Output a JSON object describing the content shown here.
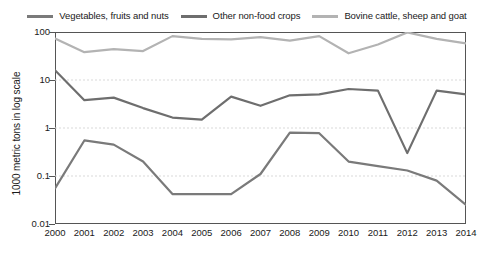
{
  "chart_data": {
    "type": "line",
    "title": "",
    "subtitle": "",
    "xlabel": "",
    "ylabel": "1000 metric tons in log scale",
    "yscale": "log",
    "ylim": [
      0.01,
      100
    ],
    "ytick_labels": [
      "100",
      "10",
      "1",
      "0.1",
      "0.01"
    ],
    "ytick_values": [
      100,
      10,
      1,
      0.1,
      0.01
    ],
    "grid": true,
    "grid_axis": "y",
    "legend_position": "top-center",
    "x": [
      2000,
      2001,
      2002,
      2003,
      2004,
      2005,
      2006,
      2007,
      2008,
      2009,
      2010,
      2011,
      2012,
      2013,
      2014
    ],
    "categories": [
      "2000",
      "2001",
      "2002",
      "2003",
      "2004",
      "2005",
      "2006",
      "2007",
      "2008",
      "2009",
      "2010",
      "2011",
      "2012",
      "2013",
      "2014"
    ],
    "series": [
      {
        "name": "Vegetables, fruits and nuts",
        "color": "#7a7a7a",
        "values": [
          0.055,
          0.55,
          0.45,
          0.2,
          0.042,
          0.042,
          0.042,
          0.11,
          0.8,
          0.78,
          0.2,
          0.16,
          0.13,
          0.08,
          0.025
        ]
      },
      {
        "name": "Other non-food crops",
        "color": "#6e6e6e",
        "values": [
          16,
          3.8,
          4.3,
          2.6,
          1.65,
          1.5,
          4.5,
          2.9,
          4.8,
          5.0,
          6.5,
          6.0,
          0.3,
          6.0,
          5.0
        ]
      },
      {
        "name": "Bovine cattle, sheep and goat",
        "color": "#b3b3b3",
        "values": [
          73,
          38,
          44,
          40,
          82,
          72,
          70,
          78,
          66,
          82,
          36,
          55,
          98,
          72,
          58
        ]
      }
    ]
  },
  "legend": {
    "entries": [
      {
        "label": "Vegetables, fruits and nuts",
        "color": "#7a7a7a"
      },
      {
        "label": "Other non-food crops",
        "color": "#6e6e6e"
      },
      {
        "label": "Bovine cattle, sheep and goat",
        "color": "#b3b3b3"
      }
    ]
  },
  "axes": {
    "y_title": "1000 metric tons in log scale",
    "y_ticks": [
      "100",
      "10",
      "1",
      "0.1",
      "0.01"
    ],
    "x_ticks": [
      "2000",
      "2001",
      "2002",
      "2003",
      "2004",
      "2005",
      "2006",
      "2007",
      "2008",
      "2009",
      "2010",
      "2011",
      "2012",
      "2013",
      "2014"
    ]
  },
  "style": {
    "frame_color": "#555555",
    "grid_color": "#d9d9d9",
    "text_color": "#1a1a1a",
    "background": "#ffffff"
  }
}
